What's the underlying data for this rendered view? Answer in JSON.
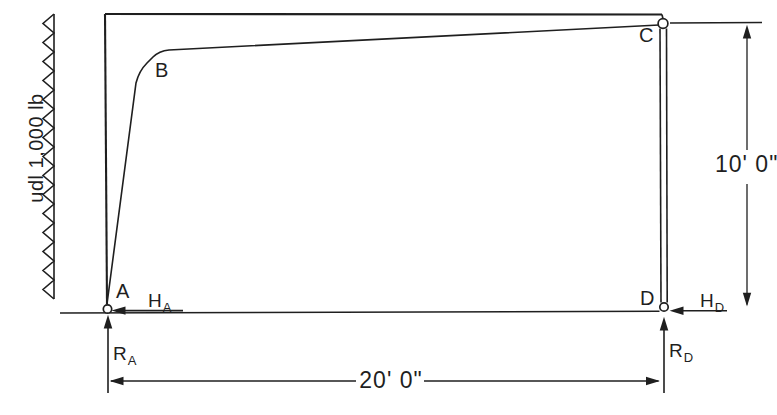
{
  "colors": {
    "ink": "#1f1f1f",
    "paper": "#ffffff"
  },
  "load": {
    "label": "udl 1,000 lb"
  },
  "nodes": {
    "a": "A",
    "b": "B",
    "c": "C",
    "d": "D"
  },
  "dims": {
    "height_label": "10' 0\"",
    "width_label": "20' 0\""
  },
  "forces": {
    "ha": {
      "sym": "H",
      "sub": "A"
    },
    "hd": {
      "sym": "H",
      "sub": "D"
    },
    "ra": {
      "sym": "R",
      "sub": "A"
    },
    "rd": {
      "sym": "R",
      "sub": "D"
    }
  }
}
